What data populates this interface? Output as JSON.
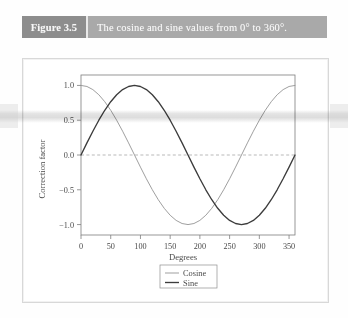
{
  "figure": {
    "tag": "Figure 3.5",
    "caption": "The cosine and sine values from 0° to 360°."
  },
  "colors": {
    "tag_band": "#8d8d8d",
    "caption_band": "#a9a9a9",
    "card_background": "#ffffff",
    "cosine_line": "#9a9a9a",
    "sine_line": "#3c3c3c",
    "zero_line": "#9b9b9b",
    "frame": "#7d7d7d"
  },
  "chart_data": {
    "type": "line",
    "title": "",
    "xlabel": "Degrees",
    "ylabel": "Correction factor",
    "xlim": [
      0,
      360
    ],
    "ylim": [
      -1.15,
      1.15
    ],
    "xticks": [
      0,
      50,
      100,
      150,
      200,
      250,
      300,
      350
    ],
    "yticks": [
      1.0,
      0.5,
      0.0,
      -0.5,
      -1.0
    ],
    "xtick_labels": [
      "0",
      "50",
      "100",
      "150",
      "200",
      "250",
      "300",
      "350"
    ],
    "ytick_labels": [
      "1.0",
      "0.5",
      "0.0",
      "−0.5",
      "−1.0"
    ],
    "grid": false,
    "reference_lines": [
      {
        "axis": "y",
        "value": 0.0,
        "style": "dashed"
      }
    ],
    "legend": {
      "position": "below-right",
      "entries": [
        "Cosine",
        "Sine"
      ]
    },
    "x": [
      0,
      10,
      20,
      30,
      40,
      50,
      60,
      70,
      80,
      90,
      100,
      110,
      120,
      130,
      140,
      150,
      160,
      170,
      180,
      190,
      200,
      210,
      220,
      230,
      240,
      250,
      260,
      270,
      280,
      290,
      300,
      310,
      320,
      330,
      340,
      350,
      360
    ],
    "series": [
      {
        "name": "Cosine",
        "values": [
          1.0,
          0.985,
          0.94,
          0.866,
          0.766,
          0.643,
          0.5,
          0.342,
          0.174,
          0.0,
          -0.174,
          -0.342,
          -0.5,
          -0.643,
          -0.766,
          -0.866,
          -0.94,
          -0.985,
          -1.0,
          -0.985,
          -0.94,
          -0.866,
          -0.766,
          -0.643,
          -0.5,
          -0.342,
          -0.174,
          0.0,
          0.174,
          0.342,
          0.5,
          0.643,
          0.766,
          0.866,
          0.94,
          0.985,
          1.0
        ]
      },
      {
        "name": "Sine",
        "values": [
          0.0,
          0.174,
          0.342,
          0.5,
          0.643,
          0.766,
          0.866,
          0.94,
          0.985,
          1.0,
          0.985,
          0.94,
          0.866,
          0.766,
          0.643,
          0.5,
          0.342,
          0.174,
          0.0,
          -0.174,
          -0.342,
          -0.5,
          -0.643,
          -0.766,
          -0.866,
          -0.94,
          -0.985,
          -1.0,
          -0.985,
          -0.94,
          -0.866,
          -0.766,
          -0.643,
          -0.5,
          -0.342,
          -0.174,
          0.0
        ]
      }
    ]
  }
}
